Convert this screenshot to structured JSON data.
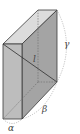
{
  "figure": {
    "type": "rectangular-box-diagram",
    "labels": {
      "diagonal": "l",
      "alpha": "α",
      "beta": "β",
      "gamma": "γ"
    },
    "colors": {
      "front_face": "#b9b9b9",
      "top_face": "#dcdcdc",
      "right_face": "#9c9c9c",
      "edge": "#3a3a3a",
      "dashed": "#8a8a8a"
    }
  }
}
